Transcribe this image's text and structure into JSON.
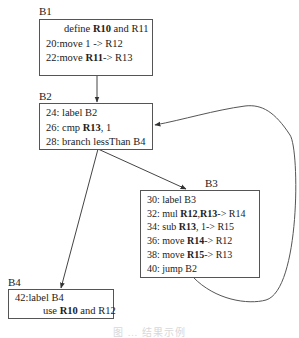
{
  "diagram": {
    "type": "control-flow-graph",
    "blocks": [
      {
        "id": "B1",
        "label": "B1",
        "lines": [
          {
            "segments": [
              {
                "t": "define ",
                "b": false
              },
              {
                "t": "R10",
                "b": true
              },
              {
                "t": " and R11",
                "b": false
              }
            ]
          },
          {
            "segments": [
              {
                "t": "20:move 1 -> R12",
                "b": false
              }
            ]
          },
          {
            "segments": [
              {
                "t": "22:move ",
                "b": false
              },
              {
                "t": "R11",
                "b": true
              },
              {
                "t": "-> R13",
                "b": false
              }
            ]
          }
        ]
      },
      {
        "id": "B2",
        "label": "B2",
        "lines": [
          {
            "segments": [
              {
                "t": "24: label B2",
                "b": false
              }
            ]
          },
          {
            "segments": [
              {
                "t": "26: cmp ",
                "b": false
              },
              {
                "t": "R13",
                "b": true
              },
              {
                "t": ", 1",
                "b": false
              }
            ]
          },
          {
            "segments": [
              {
                "t": "28: branch lessThan B4",
                "b": false
              }
            ]
          }
        ]
      },
      {
        "id": "B3",
        "label": "B3",
        "lines": [
          {
            "segments": [
              {
                "t": "30: label B3",
                "b": false
              }
            ]
          },
          {
            "segments": [
              {
                "t": "32: mul ",
                "b": false
              },
              {
                "t": "R12",
                "b": true
              },
              {
                "t": ",",
                "b": false
              },
              {
                "t": "R13",
                "b": true
              },
              {
                "t": "-> R14",
                "b": false
              }
            ]
          },
          {
            "segments": [
              {
                "t": "34: sub ",
                "b": false
              },
              {
                "t": "R13",
                "b": true
              },
              {
                "t": ", 1-> R15",
                "b": false
              }
            ]
          },
          {
            "segments": [
              {
                "t": "36: move ",
                "b": false
              },
              {
                "t": "R14",
                "b": true
              },
              {
                "t": "-> R12",
                "b": false
              }
            ]
          },
          {
            "segments": [
              {
                "t": "38: move ",
                "b": false
              },
              {
                "t": "R15",
                "b": true
              },
              {
                "t": "-> R13",
                "b": false
              }
            ]
          },
          {
            "segments": [
              {
                "t": "40: jump B2",
                "b": false
              }
            ]
          }
        ]
      },
      {
        "id": "B4",
        "label": "B4",
        "lines": [
          {
            "segments": [
              {
                "t": "42:label B4",
                "b": false
              }
            ]
          },
          {
            "segments": [
              {
                "t": "use ",
                "b": false
              },
              {
                "t": "R10",
                "b": true
              },
              {
                "t": " and R12",
                "b": false
              }
            ]
          }
        ]
      }
    ],
    "edges": [
      {
        "from": "B1",
        "to": "B2"
      },
      {
        "from": "B2",
        "to": "B3"
      },
      {
        "from": "B2",
        "to": "B4"
      },
      {
        "from": "B3",
        "to": "B2"
      }
    ],
    "caption": "图 … 结果示例"
  }
}
